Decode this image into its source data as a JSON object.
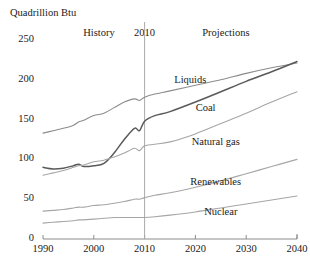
{
  "chart_data": {
    "type": "line",
    "title": "",
    "ylabel": "Quadrillion Btu",
    "xlabel": "",
    "xlim": [
      1990,
      2040
    ],
    "ylim": [
      0,
      265
    ],
    "grid": false,
    "legend_position": "inline-annotations",
    "yticks": [
      0,
      50,
      100,
      150,
      200,
      250
    ],
    "xticks": [
      1990,
      2000,
      2010,
      2020,
      2030,
      2040
    ],
    "annotations": [
      {
        "text": "History",
        "x": 2001,
        "y": 258
      },
      {
        "text": "2010",
        "x": 2010,
        "y": 258
      },
      {
        "text": "Projections",
        "x": 2026,
        "y": 258
      }
    ],
    "divider_year": 2010,
    "x": [
      1990,
      1992,
      1994,
      1996,
      1997,
      1998,
      2000,
      2002,
      2004,
      2006,
      2008,
      2009,
      2010,
      2012,
      2015,
      2020,
      2025,
      2030,
      2035,
      2040
    ],
    "series": [
      {
        "name": "Liquids",
        "color": "#8c8c8c",
        "label_x": 2019,
        "label_y": 198,
        "values": [
          133,
          136,
          139,
          143,
          147,
          149,
          155,
          158,
          165,
          172,
          176,
          174,
          178,
          182,
          186,
          193,
          200,
          208,
          215,
          221
        ]
      },
      {
        "name": "Coal",
        "color": "#5a5a5a",
        "label_x": 2022,
        "label_y": 163,
        "values": [
          90,
          88,
          89,
          92,
          94,
          91,
          92,
          95,
          108,
          125,
          139,
          136,
          148,
          155,
          160,
          172,
          185,
          198,
          210,
          223
        ]
      },
      {
        "name": "Natural gas",
        "color": "#a6a6a6",
        "label_x": 2024,
        "label_y": 120,
        "values": [
          80,
          83,
          86,
          90,
          92,
          93,
          97,
          99,
          103,
          108,
          114,
          111,
          117,
          119,
          122,
          132,
          145,
          158,
          172,
          185
        ]
      },
      {
        "name": "Renewables",
        "color": "#a6a6a6",
        "label_x": 2024,
        "label_y": 70,
        "values": [
          35,
          36,
          37,
          39,
          40,
          40,
          42,
          43,
          45,
          47,
          50,
          50,
          52,
          55,
          58,
          65,
          73,
          82,
          91,
          100
        ]
      },
      {
        "name": "Nuclear",
        "color": "#a6a6a6",
        "label_x": 2025,
        "label_y": 33,
        "values": [
          20,
          21,
          22,
          23,
          24,
          24,
          25,
          26,
          27,
          27,
          27,
          27,
          27,
          28,
          30,
          34,
          39,
          44,
          49,
          54
        ]
      }
    ]
  },
  "colors": {
    "axis": "#8c8c8c",
    "divider": "#aaaaaa",
    "text": "#1a1a1a"
  }
}
